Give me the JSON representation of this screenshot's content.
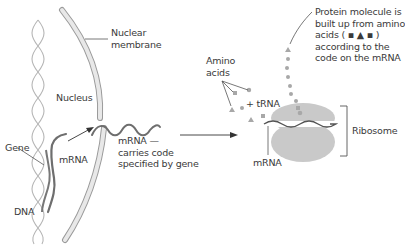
{
  "labels": {
    "nuclear_membrane": [
      "Nuclear",
      "membrane"
    ],
    "nucleus": "Nucleus",
    "gene": "Gene",
    "mrna_left": "mRNA",
    "dna": "DNA",
    "mrna_middle": [
      "mRNA —",
      "carries code",
      "specified by gene"
    ],
    "amino_acids": [
      "Amino",
      "acids"
    ],
    "trna": "+ tRNA",
    "protein": [
      "Protein molecule is",
      "built up from amino",
      "acids ( ▪ ▲ ▪ )",
      "according to the",
      "code on the mRNA"
    ],
    "ribosome": "Ribosome",
    "mrna_right": "mRNA"
  },
  "colors": {
    "membrane_fill": "#e6e6e6",
    "membrane_stroke": "#9a9a9a",
    "dna_strand": "#b5b5b5",
    "mrna": "#6e6e6e",
    "ribosome": "#c9c9c9",
    "amino_acid": "#a8a8a8",
    "line": "#555555",
    "text": "#3a3a3a"
  }
}
